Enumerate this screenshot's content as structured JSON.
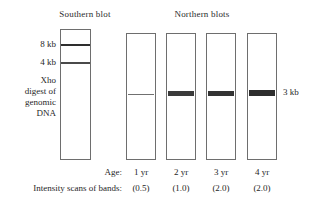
{
  "figure": {
    "southern_title": "Southern blot",
    "northern_title": "Northern blots"
  },
  "southern": {
    "markers": [
      {
        "label": "8 kb"
      },
      {
        "label": "4 kb"
      }
    ],
    "description_lines": [
      "Xho",
      "digest of",
      "genomic",
      "DNA"
    ]
  },
  "northern": {
    "right_marker": "3 kb",
    "lanes": [
      {
        "age": "1 yr",
        "intensity": "(0.5)"
      },
      {
        "age": "2 yr",
        "intensity": "(1.0)"
      },
      {
        "age": "3 yr",
        "intensity": "(2.0)"
      },
      {
        "age": "4 yr",
        "intensity": "(2.0)"
      }
    ]
  },
  "rows": {
    "age_label": "Age:",
    "intensity_label": "Intensity scans of bands:"
  },
  "chart_data": {
    "type": "table",
    "categories": [
      "1 yr",
      "2 yr",
      "3 yr",
      "4 yr"
    ],
    "values": [
      0.5,
      1.0,
      2.0,
      2.0
    ],
    "xlabel": "Age",
    "ylabel": "Intensity scans of bands",
    "southern_bands_kb": [
      8,
      4
    ],
    "northern_band_kb": 3
  }
}
